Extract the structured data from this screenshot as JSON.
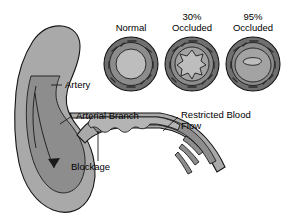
{
  "figure": {
    "background_color": "#ffffff",
    "text_color": "#000000"
  },
  "palette": {
    "artery_wall": "#a9a9a9",
    "artery_lumen": "#8d8d8d",
    "plaque": "#b4b4b4",
    "ring_outer": "#6f6f6f",
    "ring_middle": "#8c8c8c",
    "lumen_light": "#bdbdbd",
    "outline": "#141414",
    "leader": "#1a1a1a"
  },
  "cross_sections": [
    {
      "id": "normal",
      "label_lines": [
        "Normal"
      ],
      "occlusion_percent": 0,
      "lumen_shape": "open-circle",
      "cx": 131,
      "cy": 64,
      "r": 27
    },
    {
      "id": "occluded-30",
      "label_lines": [
        "30%",
        "Occluded"
      ],
      "occlusion_percent": 30,
      "lumen_shape": "star",
      "cx": 192,
      "cy": 64,
      "r": 27
    },
    {
      "id": "occluded-95",
      "label_lines": [
        "95%",
        "Occluded"
      ],
      "occlusion_percent": 95,
      "lumen_shape": "slit",
      "cx": 253,
      "cy": 64,
      "r": 27
    }
  ],
  "callouts": [
    {
      "id": "artery",
      "label_lines": [
        "Artery"
      ],
      "text_x": 65,
      "text_y": 88
    },
    {
      "id": "arterial-branch",
      "label_lines": [
        "Arterial Branch"
      ],
      "text_x": 76,
      "text_y": 119
    },
    {
      "id": "blockage",
      "label_lines": [
        "Blockage"
      ],
      "text_x": 71,
      "text_y": 170
    },
    {
      "id": "restricted-blood-flow",
      "label_lines": [
        "Restricted Blood",
        "Flow"
      ],
      "text_x": 181,
      "text_y": 118
    }
  ],
  "flow_arrow": {
    "id": "blood-flow-arrow",
    "direction": "down-curving"
  }
}
